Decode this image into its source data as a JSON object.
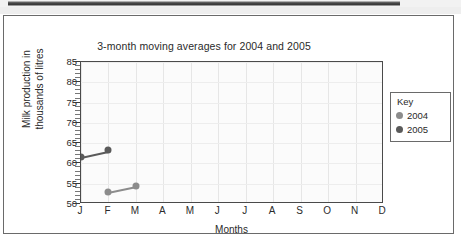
{
  "scan_artifact": {
    "name": "page-scan-bar"
  },
  "chart_data": {
    "type": "line",
    "title": "3-month moving averages for 2004 and 2005",
    "xlabel": "Months",
    "ylabel_line1": "Milk production in",
    "ylabel_line2": "thousands of litres",
    "categories": [
      "J",
      "F",
      "M",
      "A",
      "M",
      "J",
      "J",
      "A",
      "S",
      "O",
      "N",
      "D"
    ],
    "ytick_labels": [
      "50",
      "55",
      "60",
      "65",
      "70",
      "75",
      "80",
      "85"
    ],
    "ytick_values": [
      50,
      55,
      60,
      65,
      70,
      75,
      80,
      85
    ],
    "ylim": [
      50,
      85
    ],
    "y_minor_step": 1,
    "grid": true,
    "legend_position": "right-outside",
    "legend_title": "Key",
    "series": [
      {
        "name": "2004",
        "color": "#8c8c8c",
        "x": [
          "F",
          "M"
        ],
        "values": [
          53.0,
          54.4
        ]
      },
      {
        "name": "2005",
        "color": "#5a5a5a",
        "x": [
          "J",
          "F"
        ],
        "values": [
          61.7,
          63.2
        ]
      }
    ]
  }
}
